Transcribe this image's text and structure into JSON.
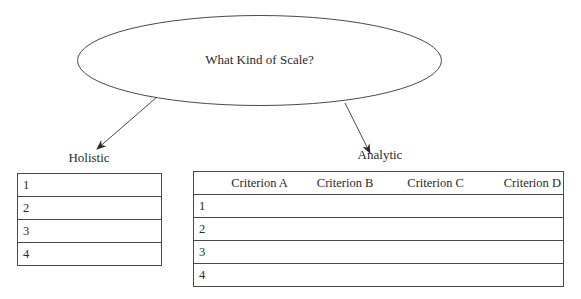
{
  "diagram": {
    "root": {
      "label": "What Kind of Scale?"
    },
    "branches": {
      "holistic": {
        "label": "Holistic",
        "rows": [
          "1",
          "2",
          "3",
          "4"
        ]
      },
      "analytic": {
        "label": "Analytic",
        "columns": [
          "Criterion A",
          "Criterion B",
          "Criterion C",
          "Criterion D"
        ],
        "rows": [
          "1",
          "2",
          "3",
          "4"
        ]
      }
    },
    "colors": {
      "line": "#4a4a4a",
      "text": "#2a2a2a",
      "background": "#ffffff"
    }
  }
}
